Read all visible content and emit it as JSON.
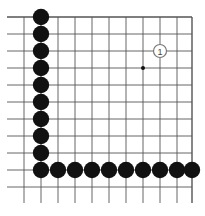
{
  "diagram": {
    "type": "go-board-fragment",
    "grid": {
      "columns_x": [
        24,
        41,
        58,
        75,
        92,
        109,
        126,
        143,
        160,
        177,
        192
      ],
      "rows_y": [
        17,
        34,
        51,
        68,
        85,
        102,
        119,
        136,
        153,
        170,
        187
      ],
      "h_line_start_x": 7,
      "v_line_end_y": 203,
      "top_edge_y": 17,
      "right_edge_x": 192,
      "line_color": "#555555"
    },
    "star_point": {
      "x": 143,
      "y": 68
    },
    "black_stones_color": "#111111",
    "black_stones_left_column": [
      {
        "x": 41,
        "y": 17
      },
      {
        "x": 41,
        "y": 34
      },
      {
        "x": 41,
        "y": 51
      },
      {
        "x": 41,
        "y": 68
      },
      {
        "x": 41,
        "y": 85
      },
      {
        "x": 41,
        "y": 102
      },
      {
        "x": 41,
        "y": 119
      },
      {
        "x": 41,
        "y": 136
      },
      {
        "x": 41,
        "y": 153
      },
      {
        "x": 41,
        "y": 170
      }
    ],
    "black_stones_bottom_row": [
      {
        "x": 58,
        "y": 170
      },
      {
        "x": 75,
        "y": 170
      },
      {
        "x": 92,
        "y": 170
      },
      {
        "x": 109,
        "y": 170
      },
      {
        "x": 126,
        "y": 170
      },
      {
        "x": 143,
        "y": 170
      },
      {
        "x": 160,
        "y": 170
      },
      {
        "x": 177,
        "y": 170
      },
      {
        "x": 192,
        "y": 170
      }
    ],
    "white_stone": {
      "x": 160,
      "y": 51,
      "label": "1"
    }
  }
}
